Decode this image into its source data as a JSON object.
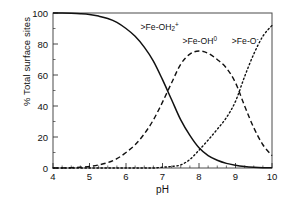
{
  "chart_data": {
    "type": "line",
    "title": "",
    "xlabel": "pH",
    "ylabel": "% Total surface sites",
    "xlim": [
      4,
      10
    ],
    "ylim": [
      0,
      100
    ],
    "xticks": [
      4,
      5,
      6,
      7,
      8,
      9,
      10
    ],
    "yticks": [
      0,
      20,
      40,
      60,
      80,
      100
    ],
    "x_minor_tick_step": 0.25,
    "y_minor_tick_step": 10,
    "grid": false,
    "legend": "inline-curve-labels",
    "x": [
      4.0,
      4.25,
      4.5,
      4.75,
      5.0,
      5.25,
      5.5,
      5.75,
      6.0,
      6.25,
      6.5,
      6.75,
      7.0,
      7.25,
      7.5,
      7.75,
      8.0,
      8.25,
      8.5,
      8.75,
      9.0,
      9.25,
      9.5,
      9.75,
      10.0
    ],
    "series": [
      {
        "name": ">Fe-OH2+",
        "label_html": "&gt;Fe-OH<sub>2</sub><sup>+</sup>",
        "linestyle": "solid",
        "color": "#111111",
        "label_x": 6.4,
        "label_y": 91,
        "values": [
          100,
          100,
          99.8,
          99.5,
          99,
          98,
          96.5,
          94,
          90,
          85,
          78,
          69,
          57,
          44,
          31,
          21,
          13,
          8,
          5,
          3,
          1.8,
          1.0,
          0.5,
          0.2,
          0.1
        ]
      },
      {
        "name": ">Fe-OH0",
        "label_html": "&gt;Fe-OH<sup>0</sup>",
        "linestyle": "dashed",
        "color": "#111111",
        "label_x": 7.55,
        "label_y": 82,
        "values": [
          0,
          0,
          0.2,
          0.5,
          1.0,
          2.0,
          3.5,
          6.0,
          10,
          15,
          22,
          31,
          42.5,
          55,
          67,
          73.5,
          75.5,
          74,
          70,
          64.5,
          55,
          40,
          26,
          15,
          8
        ]
      },
      {
        "name": ">Fe-O-",
        "label_html": "&gt;Fe-O<sup>-</sup>",
        "linestyle": "dotted",
        "color": "#111111",
        "label_x": 8.9,
        "label_y": 82,
        "values": [
          0,
          0,
          0,
          0,
          0,
          0,
          0,
          0,
          0,
          0,
          0,
          0,
          0.5,
          1.0,
          2.0,
          5.5,
          11.5,
          18,
          25,
          32.5,
          43,
          59,
          73.5,
          85,
          92
        ]
      }
    ],
    "annotations": [
      {
        "text": "curves cross: >Fe-OH2+ / >Fe-OH0",
        "x": 7.1,
        "y": 48
      },
      {
        "text": "curves cross: >Fe-OH0 / >Fe-O-",
        "x": 8.95,
        "y": 55
      }
    ]
  },
  "axes": {
    "y_title": "% Total surface sites",
    "x_title": "pH",
    "y_tick_labels": [
      "100",
      "80",
      "60",
      "40",
      "20",
      "0"
    ],
    "x_tick_labels": [
      "4",
      "5",
      "6",
      "7",
      "8",
      "9",
      "10"
    ]
  }
}
